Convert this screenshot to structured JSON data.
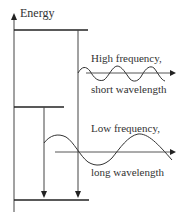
{
  "axis": {
    "label": "Energy"
  },
  "levels": [
    {
      "name": "upper",
      "y": 30,
      "x1": 14,
      "x2": 88
    },
    {
      "name": "middle",
      "y": 107,
      "x1": 14,
      "x2": 64
    },
    {
      "name": "ground",
      "y": 200,
      "x1": 14,
      "x2": 89
    }
  ],
  "transitions": [
    {
      "from": "upper",
      "to": "ground",
      "x": 78
    },
    {
      "from": "middle",
      "to": "ground",
      "x": 44
    }
  ],
  "waves": {
    "high": {
      "line1": "High frequency,",
      "line2": "short wavelength"
    },
    "low": {
      "line1": "Low frequency,",
      "line2": "long wavelength"
    }
  },
  "colors": {
    "line": "#222222",
    "text": "#333333"
  }
}
